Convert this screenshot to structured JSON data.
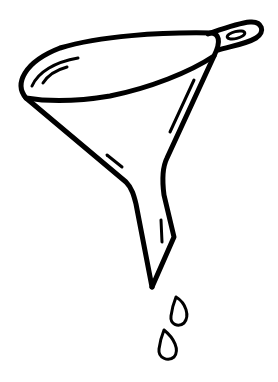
{
  "image": {
    "subject": "funnel-with-drops line drawing",
    "background_color": "#ffffff",
    "stroke_color": "#000000"
  }
}
